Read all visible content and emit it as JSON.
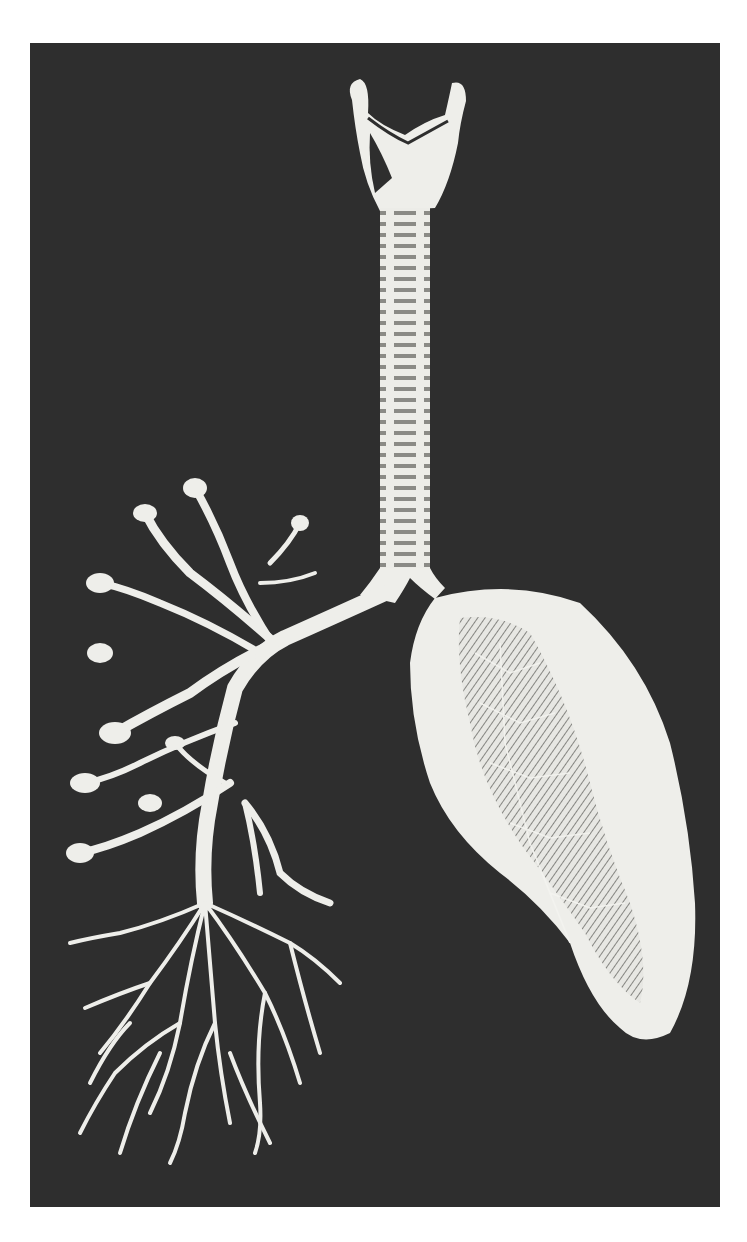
{
  "image": {
    "description": "Vintage anatomical engraving of the human respiratory tract on a dark background: larynx, trachea, a branching bronchial tree on the left and a whole lung on the right",
    "colors": {
      "page_background": "#ffffff",
      "plate_background": "#2e2e2e",
      "illustration": "#eeeeea",
      "shading": "#8a8a86"
    },
    "parts": {
      "larynx": "larynx",
      "trachea": "trachea",
      "bronchial_tree": "bronchial tree",
      "lung": "lung"
    }
  }
}
